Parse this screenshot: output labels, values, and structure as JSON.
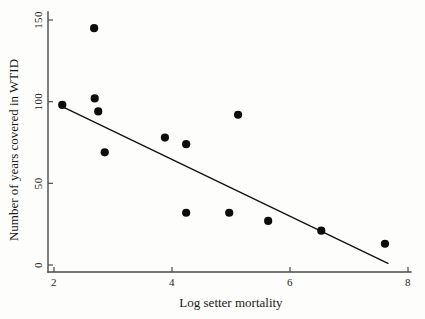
{
  "chart_data": {
    "type": "scatter",
    "title": "",
    "xlabel": "Log setter mortality",
    "ylabel": "Number of years covered in WTID",
    "xlim": [
      1.9,
      8.1
    ],
    "ylim": [
      -3,
      155
    ],
    "xticks": [
      2,
      4,
      6,
      8
    ],
    "xtick_labels": [
      "2",
      "4",
      "6",
      "8"
    ],
    "yticks": [
      0,
      50,
      100,
      150
    ],
    "ytick_labels": [
      "0",
      "50",
      "100",
      "150"
    ],
    "grid": false,
    "legend": false,
    "marker_color": "#0d0d0d",
    "line_color": "#111111",
    "axis_color": "#4a4a48",
    "background": "#fdfdfb",
    "points": [
      {
        "x": 2.14,
        "y": 98
      },
      {
        "x": 2.68,
        "y": 145
      },
      {
        "x": 2.69,
        "y": 102
      },
      {
        "x": 2.75,
        "y": 94
      },
      {
        "x": 2.86,
        "y": 69
      },
      {
        "x": 3.88,
        "y": 78
      },
      {
        "x": 4.24,
        "y": 74
      },
      {
        "x": 4.24,
        "y": 32
      },
      {
        "x": 4.97,
        "y": 32
      },
      {
        "x": 5.12,
        "y": 92
      },
      {
        "x": 5.63,
        "y": 27
      },
      {
        "x": 6.53,
        "y": 21
      },
      {
        "x": 7.61,
        "y": 13
      }
    ],
    "fit_line": {
      "x1": 2.14,
      "y1": 97,
      "x2": 7.66,
      "y2": 1
    }
  }
}
